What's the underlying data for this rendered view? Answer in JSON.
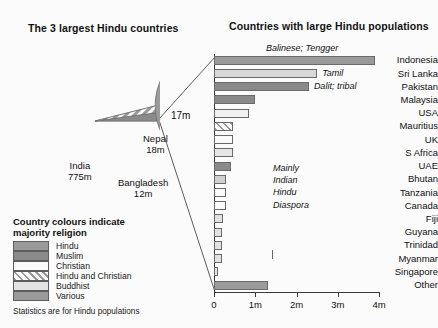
{
  "pie_panel": {
    "title": "The 3 largest Hindu countries",
    "callout": "17m",
    "slices": [
      {
        "name": "India",
        "value_label": "775m",
        "value": 775,
        "religion": "Hindu",
        "color": "#9a9a9a"
      },
      {
        "name": "Nepal",
        "value_label": "18m",
        "value": 18,
        "religion": "Hindu and Christian",
        "color": "hatch"
      },
      {
        "name": "Bangladesh",
        "value_label": "12m",
        "value": 12,
        "religion": "Muslim",
        "color": "#8a8a8a"
      }
    ],
    "labels": {
      "india": "India\n775m",
      "india_name": "India",
      "india_value": "775m",
      "nepal_name": "Nepal",
      "nepal_value": "18m",
      "bangladesh_name": "Bangladesh",
      "bangladesh_value": "12m"
    }
  },
  "legend": {
    "title_line1": "Country colours indicate",
    "title_line2": "majority religion",
    "items": [
      {
        "label": "Hindu",
        "swatch": "#9a9a9a"
      },
      {
        "label": "Muslim",
        "swatch": "#8a8a8a"
      },
      {
        "label": "Christian",
        "swatch": "#fafafa"
      },
      {
        "label": "Hindu and Christian",
        "swatch": "hatch"
      },
      {
        "label": "Buddhist",
        "swatch": "#e2e2e2"
      },
      {
        "label": "Various",
        "swatch": "#9a9a9a"
      }
    ],
    "footnote": "Statistics are for Hindu populations"
  },
  "chart_data": {
    "type": "bar",
    "orientation": "horizontal",
    "title": "Countries with large  Hindu populations",
    "xlabel": "",
    "ylabel": "",
    "xlim": [
      0,
      4
    ],
    "grid": false,
    "unit": "millions",
    "tick_labels": [
      "0",
      "1m",
      "2m",
      "3m",
      "4m"
    ],
    "tick_values": [
      0,
      1,
      2,
      3,
      4
    ],
    "categories": [
      "Indonesia",
      "Sri Lanka",
      "Pakistan",
      "Malaysia",
      "USA",
      "Mauritius",
      "UK",
      "S Africa",
      "UAE",
      "Bhutan",
      "Tanzania",
      "Canada",
      "Fiji",
      "Guyana",
      "Trinidad",
      "Myanmar",
      "Singapore",
      "Other"
    ],
    "values": [
      3.9,
      2.5,
      2.3,
      1.0,
      0.85,
      0.45,
      0.45,
      0.45,
      0.4,
      0.3,
      0.28,
      0.28,
      0.22,
      0.2,
      0.2,
      0.2,
      0.1,
      1.3
    ],
    "fills": [
      "#9a9a9a",
      "#d8d8d8",
      "#8a8a8a",
      "#8a8a8a",
      "#f2f2f2",
      "hatch",
      "#fafafa",
      "#e6e6e6",
      "#8a8a8a",
      "#d0d0d0",
      "#fafafa",
      "#fafafa",
      "#e2e2e2",
      "#e2e2e2",
      "#e2e2e2",
      "#e2e2e2",
      "#e2e2e2",
      "#9a9a9a"
    ],
    "annotations": [
      {
        "text": "Balinese; Tengger",
        "for": "Indonesia"
      },
      {
        "text": "Tamil",
        "for": "Sri Lanka"
      },
      {
        "text": "Dalit; tribal",
        "for": "Pakistan"
      }
    ],
    "diaspora_note": [
      "Mainly",
      "Indian",
      "Hindu",
      "Diaspora"
    ]
  }
}
